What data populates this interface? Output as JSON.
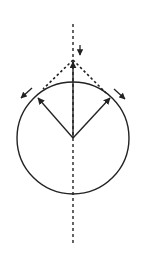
{
  "diagram": {
    "type": "geometry-vector-diagram",
    "colors": {
      "stroke": "#222222",
      "background": "#ffffff"
    },
    "circle": {
      "cx": 73,
      "cy": 138,
      "r": 56
    },
    "axis": {
      "x": 73,
      "y1": 24,
      "y2": 246,
      "style": "dashed"
    },
    "apex": {
      "x": 73,
      "y": 60
    },
    "vectors": [
      {
        "name": "vertical-radius-vector",
        "from": [
          73,
          138
        ],
        "to": [
          73,
          62
        ]
      },
      {
        "name": "left-radius-vector",
        "from": [
          73,
          138
        ],
        "to": [
          38,
          98
        ]
      },
      {
        "name": "right-radius-vector",
        "from": [
          73,
          138
        ],
        "to": [
          110,
          98
        ]
      }
    ],
    "dashed_tangents": [
      {
        "name": "left-tangent-line",
        "from": [
          73,
          60
        ],
        "to": [
          43,
          89
        ]
      },
      {
        "name": "right-tangent-line",
        "from": [
          73,
          60
        ],
        "to": [
          106,
          93
        ]
      }
    ],
    "small_arrows": [
      {
        "name": "down-arrow",
        "from": [
          80,
          45
        ],
        "to": [
          80,
          55
        ]
      },
      {
        "name": "left-tangent-arrow",
        "from": [
          32,
          88
        ],
        "to": [
          21,
          98
        ]
      },
      {
        "name": "right-tangent-arrow",
        "from": [
          114,
          89
        ],
        "to": [
          125,
          99
        ]
      }
    ]
  }
}
